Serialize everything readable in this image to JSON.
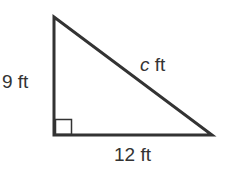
{
  "diagram": {
    "type": "right-triangle",
    "vertical_leg": {
      "value": "9",
      "unit": "ft",
      "label": "9 ft"
    },
    "horizontal_leg": {
      "value": "12",
      "unit": "ft",
      "label": "12 ft"
    },
    "hypotenuse": {
      "variable": "c",
      "unit": "ft"
    },
    "right_angle_marker": true,
    "stroke_color": "#333333"
  }
}
